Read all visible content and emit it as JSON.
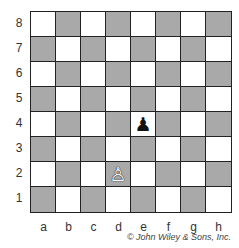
{
  "board": {
    "files": [
      "a",
      "b",
      "c",
      "d",
      "e",
      "f",
      "g",
      "h"
    ],
    "ranks": [
      "8",
      "7",
      "6",
      "5",
      "4",
      "3",
      "2",
      "1"
    ],
    "colors": {
      "light": "#ffffff",
      "dark": "#a9a9a9",
      "border": "#222222"
    },
    "pieces": [
      {
        "square": "e4",
        "type": "pawn",
        "color": "black",
        "glyph": "♟"
      },
      {
        "square": "d2",
        "type": "pawn",
        "color": "white",
        "glyph": "♙"
      }
    ]
  },
  "copyright": "© John Wiley & Sons, Inc."
}
